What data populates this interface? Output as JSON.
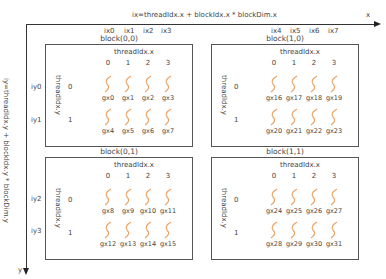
{
  "top_axis": {
    "formula": "ix=threadIdx.x + blockIdx.x * blockDim.x",
    "end_label": "x",
    "ix_labels_left": [
      "ix0",
      "ix1",
      "ix2",
      "ix3"
    ],
    "ix_labels_right": [
      "ix4",
      "ix5",
      "ix6",
      "ix7"
    ]
  },
  "left_axis": {
    "formula": "iy=threadIdx.y + blockIdx.y * blockDim.y",
    "end_label": "y",
    "iy_labels_top": [
      "iy0",
      "iy1"
    ],
    "iy_labels_bottom": [
      "iy2",
      "iy3"
    ]
  },
  "colors": {
    "thread_wave": "#f0a060",
    "border": "#555555",
    "text": "#444444"
  },
  "blocks": [
    {
      "label": "block(0,0)",
      "threadIdx_x": "threadIdx.x",
      "threadIdx_y": "threadIdx.y",
      "cols": [
        "0",
        "1",
        "2",
        "3"
      ],
      "rows": [
        "0",
        "1"
      ],
      "threads": [
        [
          "gx0",
          "gx1",
          "gx2",
          "gx3"
        ],
        [
          "gx4",
          "gx5",
          "gx6",
          "gx7"
        ]
      ]
    },
    {
      "label": "block(1,0)",
      "threadIdx_x": "threadIdx.x",
      "threadIdx_y": "threadIdx.y",
      "cols": [
        "0",
        "1",
        "2",
        "3"
      ],
      "rows": [
        "0",
        "1"
      ],
      "threads": [
        [
          "gx16",
          "gx17",
          "gx18",
          "gx19"
        ],
        [
          "gx20",
          "gx21",
          "gx22",
          "gx23"
        ]
      ]
    },
    {
      "label": "block(0,1)",
      "threadIdx_x": "threadIdx.x",
      "threadIdx_y": "threadIdx.y",
      "cols": [
        "0",
        "1",
        "2",
        "3"
      ],
      "rows": [
        "0",
        "1"
      ],
      "threads": [
        [
          "gx8",
          "gx9",
          "gx10",
          "gx11"
        ],
        [
          "gx12",
          "gx13",
          "gx14",
          "gx15"
        ]
      ]
    },
    {
      "label": "block(1,1)",
      "threadIdx_x": "threadIdx.x",
      "threadIdx_y": "threadIdx.y",
      "cols": [
        "0",
        "1",
        "2",
        "3"
      ],
      "rows": [
        "0",
        "1"
      ],
      "threads": [
        [
          "gx24",
          "gx25",
          "gx26",
          "gx27"
        ],
        [
          "gx28",
          "gx29",
          "gx30",
          "gx31"
        ]
      ]
    }
  ]
}
